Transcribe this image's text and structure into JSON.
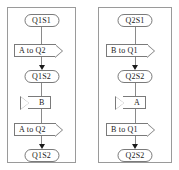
{
  "diagram": {
    "stroke_color": "#7a7a7a",
    "text_color": "#1a1a1a",
    "background": "#ffffff",
    "columns": [
      {
        "name": "left-column",
        "steps": [
          {
            "kind": "state",
            "label": "Q1S1"
          },
          {
            "kind": "send",
            "label": "A to Q2"
          },
          {
            "kind": "state",
            "label": "Q1S2"
          },
          {
            "kind": "receive",
            "label": "B"
          },
          {
            "kind": "send",
            "label": "A to Q2"
          },
          {
            "kind": "state",
            "label": "Q1S2"
          }
        ]
      },
      {
        "name": "right-column",
        "steps": [
          {
            "kind": "state",
            "label": "Q2S1"
          },
          {
            "kind": "send",
            "label": "B to Q1"
          },
          {
            "kind": "state",
            "label": "Q2S2"
          },
          {
            "kind": "receive",
            "label": "A"
          },
          {
            "kind": "send",
            "label": "B to Q1"
          },
          {
            "kind": "state",
            "label": "Q2S2"
          }
        ]
      }
    ]
  }
}
